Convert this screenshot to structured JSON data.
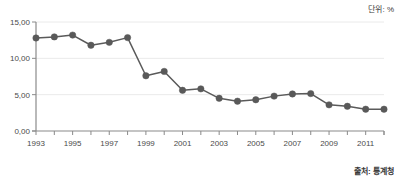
{
  "annotations": {
    "unit_label": "단위: %",
    "source_label": "출처: 통계청"
  },
  "colors": {
    "line": "#5a5a5a",
    "marker": "#595959",
    "axis": "#8a8a8a",
    "grid": "#eaeaea",
    "tick_text": "#4a4a4a",
    "background": "#ffffff"
  },
  "chart_data": {
    "type": "line",
    "title": "",
    "subtitle": "",
    "xlabel": "",
    "ylabel": "",
    "unit": "%",
    "grid": true,
    "legend": "none",
    "ylim": [
      0,
      15
    ],
    "ytick_labels": [
      "15,00",
      "10,00",
      "5,00",
      "0,00"
    ],
    "ytick_values": [
      15,
      10,
      5,
      0
    ],
    "xlim": [
      1993,
      2012
    ],
    "xtick_labels": [
      "1993",
      "1995",
      "1997",
      "1999",
      "2001",
      "2003",
      "2005",
      "2007",
      "2009",
      "2011"
    ],
    "xtick_values": [
      1993,
      1995,
      1997,
      1999,
      2001,
      2003,
      2005,
      2007,
      2009,
      2011
    ],
    "x": [
      1993,
      1994,
      1995,
      1996,
      1997,
      1998,
      1999,
      2000,
      2001,
      2002,
      2003,
      2004,
      2005,
      2006,
      2007,
      2008,
      2009,
      2010,
      2011,
      2012
    ],
    "values": [
      12.8,
      12.95,
      13.2,
      11.8,
      12.2,
      12.85,
      7.6,
      8.2,
      5.6,
      5.8,
      4.5,
      4.1,
      4.3,
      4.8,
      5.1,
      5.15,
      3.6,
      3.4,
      3.0,
      3.0
    ],
    "series": [
      {
        "name": "",
        "values": [
          12.8,
          12.95,
          13.2,
          11.8,
          12.2,
          12.85,
          7.6,
          8.2,
          5.6,
          5.8,
          4.5,
          4.1,
          4.3,
          4.8,
          5.1,
          5.15,
          3.6,
          3.4,
          3.0,
          3.0
        ]
      }
    ]
  }
}
